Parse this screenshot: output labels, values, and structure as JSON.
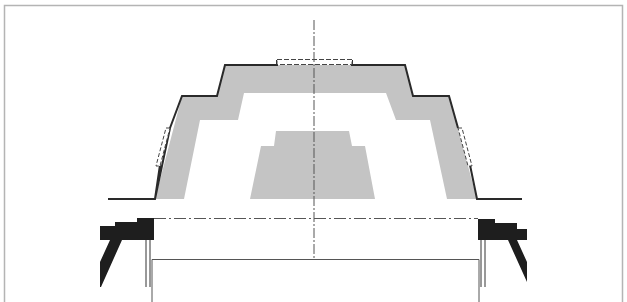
{
  "diagram": {
    "type": "technical-cross-section",
    "colors": {
      "frame": "#b4b4b4",
      "outline": "#2a2a2a",
      "fill_gray": "#c4c4c4",
      "solid_black": "#1e1e1e",
      "centerline": "#555555",
      "background": "#ffffff"
    },
    "centerline_x": 314
  }
}
